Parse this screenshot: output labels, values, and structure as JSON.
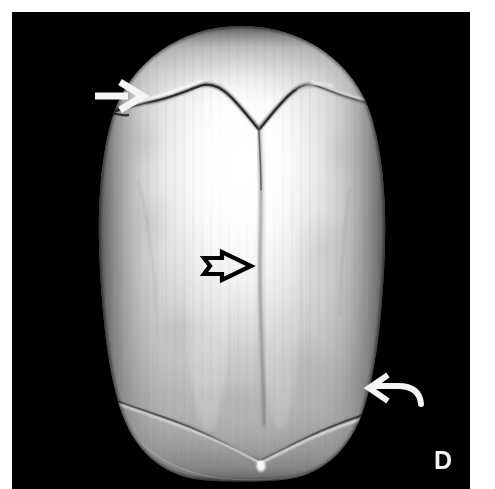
{
  "figure": {
    "panel_label": "D",
    "modality": "3D CT volume-rendered reconstruction",
    "view": "superior (vertex) view of the calvarium",
    "background_color": "#000000",
    "page_color": "#ffffff",
    "bone_color_light": "#f8f8f8",
    "bone_color_mid": "#b9b9b9",
    "bone_color_dark": "#6e6e6e",
    "annotation_white": "#f5f5f5",
    "annotation_black": "#000000"
  },
  "canvas": {
    "x": 12,
    "y": 12,
    "width": 458,
    "height": 477
  },
  "skull": {
    "name": "calvarium",
    "left_edge_x": 110,
    "right_edge_x": 375,
    "top_edge_y": 26,
    "bottom_edge_y": 480,
    "highlight_center_x": 245,
    "highlight_center_y": 165
  },
  "sutures": [
    {
      "id": "coronal-suture",
      "label": "coronal suture",
      "shape": "chevron / inverted-V across the anterior calvarium",
      "approx_y": 95
    },
    {
      "id": "metopic-sagittal-suture",
      "label": "midline sagittal suture",
      "shape": "vertical midline line descending from the chevron apex",
      "approx_x": 250
    },
    {
      "id": "lambdoid-suture",
      "label": "lambdoid suture",
      "shape": "V-shaped suture across the posterior calvarium",
      "approx_y": 415
    }
  ],
  "annotations": [
    {
      "id": "arrow-straight-white",
      "type": "straight-arrow",
      "color": "#f5f5f5",
      "direction": "right",
      "tip_x": 142,
      "tip_y": 96,
      "tail_x": 95,
      "tail_y": 96,
      "points_at": "coronal suture, left side"
    },
    {
      "id": "arrow-open-black",
      "type": "open-outline-arrow",
      "color": "#000000",
      "direction": "right",
      "tip_x": 251,
      "tip_y": 266,
      "tail_x": 203,
      "tail_y": 266,
      "points_at": "midline sagittal suture"
    },
    {
      "id": "arrow-curved-white",
      "type": "curved-arrow",
      "color": "#f5f5f5",
      "direction": "left",
      "tip_x": 370,
      "tip_y": 388,
      "tail_x": 421,
      "tail_y": 404,
      "points_at": "lambdoid suture, right side"
    }
  ]
}
